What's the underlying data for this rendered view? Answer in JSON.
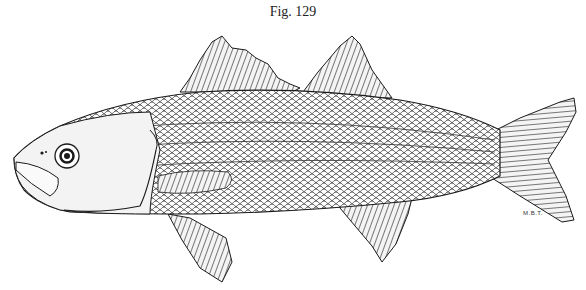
{
  "figure": {
    "caption": "Fig. 129",
    "signature": "M.B.T.",
    "colors": {
      "ink": "#1a1a1a",
      "paper": "#ffffff"
    }
  }
}
